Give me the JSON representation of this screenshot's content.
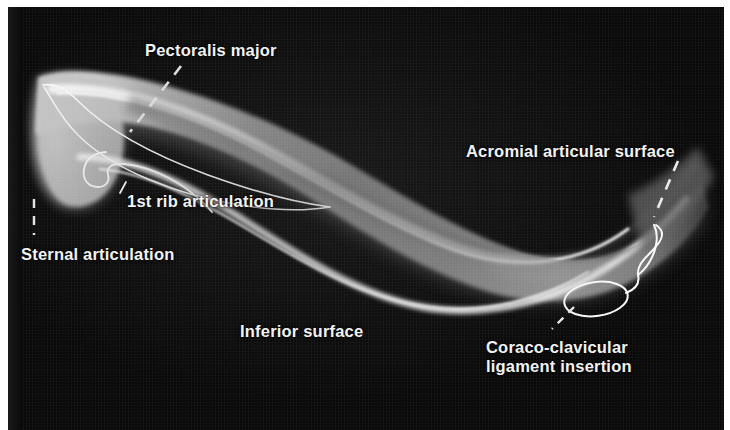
{
  "figure": {
    "view": "inferior surface",
    "background_color": "#090909",
    "label_color": "#f2f2f2",
    "outline_color": "#ffffff",
    "plate_margin_color": "#ffffff"
  },
  "labels": [
    {
      "id": "pectoralis-major",
      "text": "Pectoralis major",
      "x": 137,
      "y": 34
    },
    {
      "id": "acromial-surface",
      "text": "Acromial articular surface",
      "x": 466,
      "y": 135
    },
    {
      "id": "first-rib",
      "text": "1st rib articulation",
      "x": 127,
      "y": 185
    },
    {
      "id": "sternal",
      "text": "Sternal articulation",
      "x": 21,
      "y": 238
    },
    {
      "id": "inferior-surface",
      "text": "Inferior surface",
      "x": 240,
      "y": 315
    },
    {
      "id": "coracoclavicular-1",
      "text": "Coraco-clavicular",
      "x": 486,
      "y": 331
    },
    {
      "id": "coracoclavicular-2",
      "text": "ligament insertion",
      "x": 486,
      "y": 350
    }
  ],
  "leader_lines": [
    {
      "id": "leader-pectoralis-major",
      "style": "dashed"
    },
    {
      "id": "leader-acromial-surface",
      "style": "dashed"
    },
    {
      "id": "leader-first-rib",
      "style": "solid"
    },
    {
      "id": "leader-sternal",
      "style": "dashed"
    },
    {
      "id": "leader-coracoclavicular",
      "style": "dashed"
    }
  ],
  "annotations": [
    {
      "id": "pectoralis-major-attachment-outline",
      "shape": "long-curve",
      "description": "thin white curve tracing the pectoralis major attachment along the shaft"
    },
    {
      "id": "first-rib-facet-outline",
      "shape": "hooked-curve",
      "description": "white outline of the costal (1st rib) articulation facet near the sternal end"
    },
    {
      "id": "coracoclavicular-tuberosity-outline",
      "shape": "oval-with-tail",
      "description": "white oval with trailing line marking the coraco-clavicular ligament insertion"
    }
  ]
}
